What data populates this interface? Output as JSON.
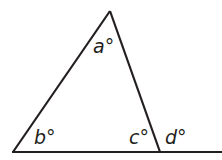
{
  "diagram": {
    "type": "triangle-exterior-angle",
    "colors": {
      "stroke": "#231f20",
      "background": "#ffffff"
    },
    "vertices": {
      "apex": [
        110,
        11
      ],
      "bottom_left": [
        13,
        152
      ],
      "bottom_right": [
        160,
        152
      ]
    },
    "baseline_end": [
      222,
      152
    ],
    "labels": {
      "a": "a°",
      "b": "b°",
      "c": "c°",
      "d": "d°"
    }
  }
}
